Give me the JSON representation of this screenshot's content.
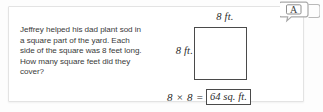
{
  "card": {
    "problem_text": "Jeffrey helped his dad plant sod in a square part of the yard. Each side of the square was 8 feet long. How many square feet did they cover?"
  },
  "figure": {
    "top_label": "8 ft.",
    "left_label": "8 ft.",
    "shape": "square"
  },
  "equation": {
    "expression": "8 × 8 =",
    "answer": "64 sq. ft."
  },
  "badge": {
    "letter": "A",
    "icon": "speech-bubbles-icon"
  },
  "colors": {
    "card_background": "#ffffff",
    "card_border": "#e3e3e3",
    "text": "#3a3a3a",
    "figure_stroke": "#4a4a4a",
    "math_text": "#2b2b2b"
  }
}
